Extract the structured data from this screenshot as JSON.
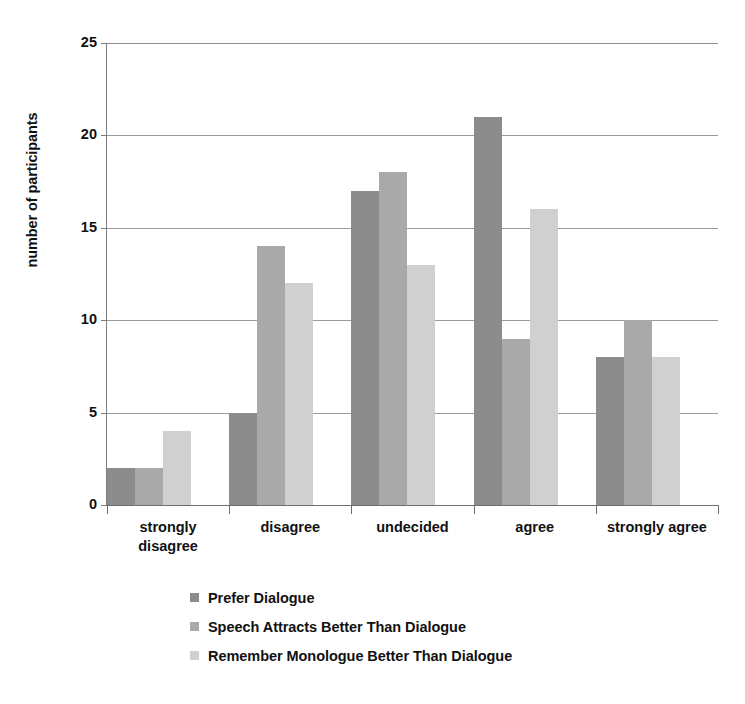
{
  "chart_data": {
    "type": "bar",
    "title": "",
    "subtitle": "",
    "xlabel": "",
    "ylabel": "number of participants",
    "ylim": [
      0,
      25
    ],
    "ytick_labels": [
      "25",
      "20",
      "15",
      "10",
      "5",
      "0"
    ],
    "ytick_values": [
      25,
      20,
      15,
      10,
      5,
      0
    ],
    "grid": true,
    "legend_position": "bottom",
    "categories": [
      "strongly\ndisagree",
      "disagree",
      "undecided",
      "agree",
      "strongly agree"
    ],
    "category_labels": [
      [
        "strongly",
        "disagree"
      ],
      [
        "disagree"
      ],
      [
        "undecided"
      ],
      [
        "agree"
      ],
      [
        "strongly agree"
      ]
    ],
    "series": [
      {
        "name": "Prefer Dialogue",
        "color": "#8c8c8c",
        "values": [
          2,
          5,
          17,
          21,
          8
        ]
      },
      {
        "name": "Speech Attracts Better Than Dialogue",
        "color": "#a9a9a9",
        "values": [
          2,
          14,
          18,
          9,
          10
        ]
      },
      {
        "name": "Remember Monologue Better Than Dialogue",
        "color": "#d0d0d0",
        "values": [
          4,
          12,
          13,
          16,
          8
        ]
      }
    ]
  },
  "axis": {
    "y_title": "number of participants"
  },
  "legend": {
    "items": [
      {
        "label": "Prefer Dialogue",
        "swatch": "legend-swatch-prefer-dialogue"
      },
      {
        "label": "Speech Attracts Better Than Dialogue",
        "swatch": "legend-swatch-speech-attracts"
      },
      {
        "label": "Remember Monologue Better Than Dialogue",
        "swatch": "legend-swatch-remember-monologue"
      }
    ]
  }
}
